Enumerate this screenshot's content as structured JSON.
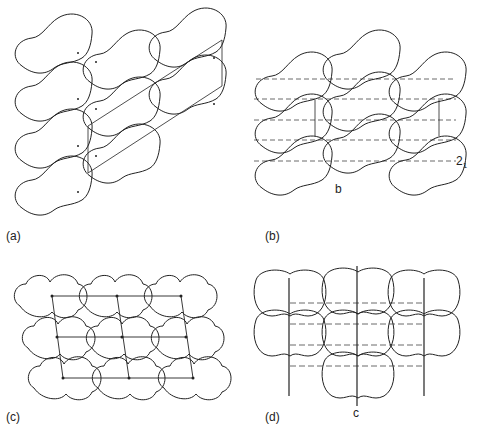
{
  "figure": {
    "panels": [
      {
        "id": "a",
        "label": "(a)"
      },
      {
        "id": "b",
        "label": "(b)",
        "axis_label": "b",
        "symmetry_label_main": "2",
        "symmetry_label_sub": "1"
      },
      {
        "id": "c",
        "label": "(c)"
      },
      {
        "id": "d",
        "label": "(d)",
        "axis_label": "c"
      }
    ],
    "colors": {
      "line": "#222222",
      "background": "#ffffff"
    }
  }
}
